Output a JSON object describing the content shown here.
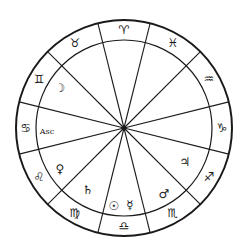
{
  "chart": {
    "center": [
      124,
      128
    ],
    "outer_radius": 108,
    "inner_radius": 88,
    "line_color": "#1a1a1a",
    "spoke_angles_deg": [
      14,
      45,
      76,
      104,
      135,
      166,
      194,
      225,
      256,
      284,
      315,
      346
    ]
  },
  "zodiac": [
    {
      "name": "aries",
      "glyph": "♈",
      "angle": 90
    },
    {
      "name": "pisces",
      "glyph": "♓",
      "angle": 60
    },
    {
      "name": "aquarius",
      "glyph": "♒",
      "angle": 30
    },
    {
      "name": "capricorn",
      "glyph": "♑",
      "angle": 0
    },
    {
      "name": "sagittarius",
      "glyph": "♐",
      "angle": -30
    },
    {
      "name": "scorpio",
      "glyph": "♏",
      "angle": -60
    },
    {
      "name": "libra",
      "glyph": "♎",
      "angle": -90
    },
    {
      "name": "virgo",
      "glyph": "♍",
      "angle": -120
    },
    {
      "name": "leo",
      "glyph": "♌",
      "angle": -150
    },
    {
      "name": "cancer",
      "glyph": "♋",
      "angle": 180
    },
    {
      "name": "gemini",
      "glyph": "♊",
      "angle": 150
    },
    {
      "name": "taurus",
      "glyph": "♉",
      "angle": 120
    }
  ],
  "planets": [
    {
      "name": "moon",
      "glyph": "☽",
      "x": 60,
      "y": 88
    },
    {
      "name": "ascendant",
      "glyph": "Asc",
      "x": 47,
      "y": 131
    },
    {
      "name": "venus",
      "glyph": "♀",
      "x": 60,
      "y": 169
    },
    {
      "name": "saturn",
      "glyph": "♄",
      "x": 88,
      "y": 190
    },
    {
      "name": "sun",
      "glyph": "☉",
      "x": 114,
      "y": 206
    },
    {
      "name": "mercury",
      "glyph": "☿",
      "x": 130,
      "y": 205
    },
    {
      "name": "mars",
      "glyph": "♂",
      "x": 164,
      "y": 194
    },
    {
      "name": "jupiter",
      "glyph": "♃",
      "x": 185,
      "y": 162
    }
  ]
}
